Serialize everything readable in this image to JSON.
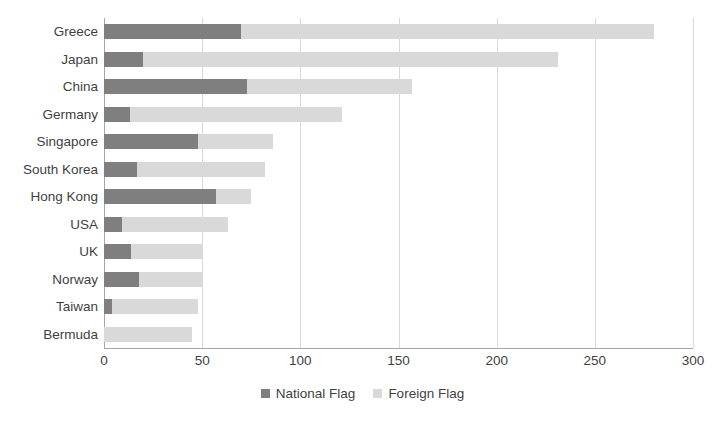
{
  "chart_data": {
    "type": "bar",
    "orientation": "horizontal",
    "stacked": true,
    "title": "",
    "subtitle": "",
    "xlabel": "",
    "ylabel": "",
    "xlim": [
      0,
      300
    ],
    "xticks": [
      0,
      50,
      100,
      150,
      200,
      250,
      300
    ],
    "xtick_labels": [
      "0",
      "50",
      "100",
      "150",
      "200",
      "250",
      "300"
    ],
    "grid": true,
    "grid_axis": "x",
    "legend_position": "bottom-center",
    "categories": [
      "Greece",
      "Japan",
      "China",
      "Germany",
      "Singapore",
      "South Korea",
      "Hong Kong",
      "USA",
      "UK",
      "Norway",
      "Taiwan",
      "Bermuda"
    ],
    "series": [
      {
        "name": "National Flag",
        "color": "#7f7f7f",
        "values": [
          70,
          20,
          73,
          13,
          48,
          17,
          57,
          9,
          14,
          18,
          4,
          0
        ]
      },
      {
        "name": "Foreign Flag",
        "color": "#d9d9d9",
        "values": [
          210,
          211,
          84,
          108,
          38,
          65,
          18,
          54,
          36,
          32,
          44,
          45
        ]
      }
    ],
    "totals": [
      280,
      231,
      157,
      121,
      86,
      82,
      75,
      63,
      50,
      50,
      48,
      45
    ]
  },
  "legend": {
    "items": [
      {
        "label": "National Flag",
        "swatch": "national-flag-swatch"
      },
      {
        "label": "Foreign Flag",
        "swatch": "foreign-flag-swatch"
      }
    ]
  },
  "colors": {
    "national_flag": "#7f7f7f",
    "foreign_flag": "#d9d9d9",
    "gridline": "#d9d9d9",
    "axis": "#a6a6a6",
    "text": "#3f3f3f",
    "background": "#ffffff"
  }
}
